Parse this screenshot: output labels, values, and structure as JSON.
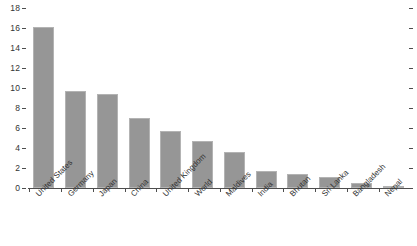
{
  "chart_data": {
    "type": "bar",
    "title": "",
    "subtitle": "",
    "xlabel": "",
    "ylabel": "",
    "categories": [
      "United States",
      "Germany",
      "Japan",
      "China",
      "United Kingdom",
      "World",
      "Maldives",
      "India",
      "Bhutan",
      "Sri Lanka",
      "Bangladesh",
      "Nepal"
    ],
    "values": [
      16.1,
      9.7,
      9.4,
      7.0,
      5.7,
      4.7,
      3.6,
      1.7,
      1.4,
      1.1,
      0.5,
      0.2
    ],
    "ylim": [
      0,
      18
    ],
    "yticks": [
      0,
      2,
      4,
      6,
      8,
      10,
      12,
      14,
      16,
      18
    ],
    "ytick_labels": [
      "0",
      "2",
      "4",
      "6",
      "8",
      "10",
      "12",
      "14",
      "16",
      "18"
    ],
    "grid": false,
    "legend": null,
    "legend_position": "none",
    "bar_color": "#969696",
    "axis_color": "#4d4d4d",
    "text_color": "#333333",
    "background": "#ffffff",
    "right_axis_ticks": true,
    "xtick_label_rotation": -45
  }
}
